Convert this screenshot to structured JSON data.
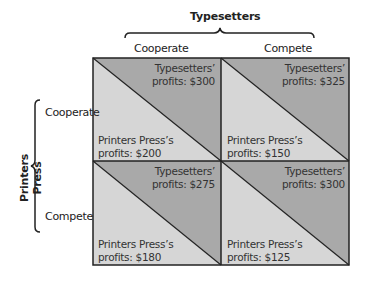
{
  "column_player": {
    "name": "Typesetters",
    "strategies": [
      "Cooperate",
      "Compete"
    ]
  },
  "row_player": {
    "name": "Printers Press",
    "strategies": [
      "Cooperate",
      "Compete"
    ]
  },
  "colors": {
    "upper_triangle": "#a9a9a9",
    "lower_triangle": "#d6d6d6",
    "border": "#222222"
  },
  "cells": [
    {
      "row": "Cooperate",
      "col": "Cooperate",
      "typesetters_line1": "Typesetters’",
      "typesetters_line2": "profits: $300",
      "printers_line1": "Printers Press’s",
      "printers_line2": "profits: $200"
    },
    {
      "row": "Cooperate",
      "col": "Compete",
      "typesetters_line1": "Typesetters’",
      "typesetters_line2": "profits: $325",
      "printers_line1": "Printers Press’s",
      "printers_line2": "profits: $150"
    },
    {
      "row": "Compete",
      "col": "Cooperate",
      "typesetters_line1": "Typesetters’",
      "typesetters_line2": "profits: $275",
      "printers_line1": "Printers Press’s",
      "printers_line2": "profits: $180"
    },
    {
      "row": "Compete",
      "col": "Compete",
      "typesetters_line1": "Typesetters’",
      "typesetters_line2": "profits: $300",
      "printers_line1": "Printers Press’s",
      "printers_line2": "profits: $125"
    }
  ]
}
